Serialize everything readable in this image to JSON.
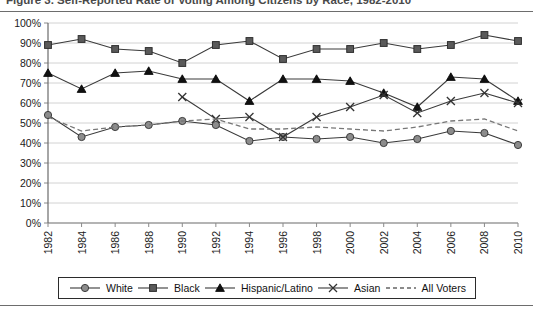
{
  "figure": {
    "caption": "Figure 3.  Self-Reported Rate of Voting Among Citizens by Race, 1982-2010"
  },
  "legend": {
    "items": [
      {
        "label": "White",
        "marker": "circle",
        "color": "#8c8c8c"
      },
      {
        "label": "Black",
        "marker": "square",
        "color": "#5a5a5a"
      },
      {
        "label": "Hispanic/Latino",
        "marker": "triangle",
        "color": "#111111"
      },
      {
        "label": "Asian",
        "marker": "x",
        "color": "#333333"
      },
      {
        "label": "All Voters",
        "marker": "dashed-line",
        "color": "#666666"
      }
    ]
  },
  "chart_data": {
    "type": "line",
    "title": "",
    "xlabel": "",
    "ylabel": "",
    "ylim": [
      0,
      100
    ],
    "ytick_labels": [
      "0%",
      "10%",
      "20%",
      "30%",
      "40%",
      "50%",
      "60%",
      "70%",
      "80%",
      "90%",
      "100%"
    ],
    "ytick_values": [
      0,
      10,
      20,
      30,
      40,
      50,
      60,
      70,
      80,
      90,
      100
    ],
    "grid": true,
    "legend_position": "bottom",
    "categories": [
      "1982",
      "1984",
      "1986",
      "1988",
      "1990",
      "1992",
      "1994",
      "1996",
      "1998",
      "2000",
      "2002",
      "2004",
      "2006",
      "2008",
      "2010"
    ],
    "series": [
      {
        "name": "White",
        "marker": "circle",
        "values": [
          54,
          43,
          48,
          49,
          51,
          49,
          41,
          43,
          42,
          43,
          40,
          42,
          46,
          45,
          39
        ]
      },
      {
        "name": "Black",
        "marker": "square",
        "values": [
          89,
          92,
          87,
          86,
          80,
          89,
          91,
          82,
          87,
          87,
          90,
          87,
          89,
          94,
          91
        ]
      },
      {
        "name": "Hispanic/Latino",
        "marker": "triangle",
        "values": [
          75,
          67,
          75,
          76,
          72,
          72,
          61,
          72,
          72,
          71,
          65,
          58,
          73,
          72,
          61
        ]
      },
      {
        "name": "Asian",
        "marker": "x",
        "values": [
          null,
          null,
          null,
          null,
          63,
          52,
          53,
          43,
          53,
          58,
          64,
          55,
          61,
          65,
          60
        ]
      },
      {
        "name": "All Voters",
        "marker": "none",
        "values": [
          53,
          46,
          48,
          49,
          51,
          52,
          47,
          47,
          48,
          47,
          46,
          48,
          51,
          52,
          46
        ]
      }
    ]
  }
}
